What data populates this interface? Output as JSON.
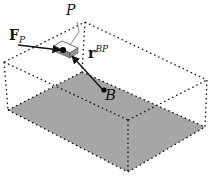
{
  "diagram": {
    "type": "3d-box-with-particle",
    "labels": {
      "particle": "P",
      "body_point": "B",
      "force_main": "F",
      "force_sub": "P",
      "vector_main": "r",
      "vector_sup": "BP"
    },
    "colors": {
      "floor": "#a6a6a6",
      "particle_box": "#8a8a8a",
      "lines": "#111111",
      "background": "#ffffff"
    },
    "elements": [
      "dotted-box-outline",
      "shaded-floor-parallelogram",
      "point-B",
      "particle-P",
      "force-arrow-F_P",
      "position-vector-r_BP"
    ]
  }
}
